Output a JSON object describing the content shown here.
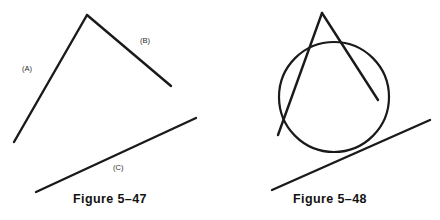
{
  "plate": {
    "background_color": "#ffffff",
    "ink_color": "#1a1a1a",
    "width": 440,
    "height": 220
  },
  "figures": [
    {
      "id": "figure-5-47",
      "caption": "Figure 5–47",
      "description": "Two line segments meeting at an apex plus a separate slanted line segment",
      "labels": [
        {
          "key": "a",
          "text": "(A)"
        },
        {
          "key": "b",
          "text": "(B)"
        },
        {
          "key": "c",
          "text": "(C)"
        }
      ],
      "geometry": {
        "stroke_width": 2.4,
        "segments": [
          {
            "name": "segment-a",
            "x1": 14,
            "y1": 142,
            "x2": 87,
            "y2": 15
          },
          {
            "name": "segment-b",
            "x1": 87,
            "y1": 15,
            "x2": 171,
            "y2": 86
          },
          {
            "name": "segment-c",
            "x1": 36,
            "y1": 192,
            "x2": 196,
            "y2": 118
          }
        ]
      }
    },
    {
      "id": "figure-5-48",
      "caption": "Figure 5–48",
      "description": "A circle inscribed tangent to three lines forming an apex above it",
      "labels": [],
      "geometry": {
        "stroke_width": 2.4,
        "circle": {
          "name": "inscribed-circle",
          "cx": 114,
          "cy": 97,
          "r": 55
        },
        "segments": [
          {
            "name": "left-tangent-line",
            "x1": 58,
            "y1": 135,
            "x2": 102,
            "y2": 13
          },
          {
            "name": "right-tangent-line",
            "x1": 102,
            "y1": 13,
            "x2": 158,
            "y2": 100
          },
          {
            "name": "bottom-tangent-line",
            "x1": 52,
            "y1": 190,
            "x2": 210,
            "y2": 120
          }
        ]
      }
    }
  ]
}
